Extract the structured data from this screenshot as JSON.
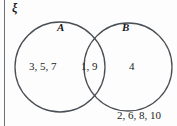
{
  "diagram": {
    "type": "venn-two-set",
    "universal_set_symbol": "ξ",
    "set_labels": {
      "left": "A",
      "right": "B"
    },
    "regions": {
      "a_only": "3, 5, 7",
      "intersection": "1, 9",
      "b_only": "4",
      "outside": "2, 6, 8, 10"
    },
    "colors": {
      "stroke": "#4a4f55",
      "frame": "#6d7278",
      "text": "#1b1f24",
      "background": "#fdfdfd"
    }
  }
}
